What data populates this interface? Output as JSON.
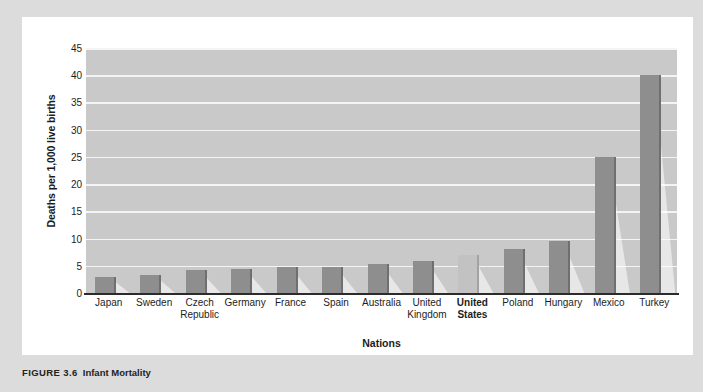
{
  "caption": {
    "figure_number": "FIGURE 3.6",
    "title": "Infant Mortality"
  },
  "chart_data": {
    "type": "bar",
    "title": "Infant Mortality",
    "xlabel": "Nations",
    "ylabel": "Deaths per 1,000 live births",
    "ylim": [
      0,
      45
    ],
    "yticks": [
      0,
      5,
      10,
      15,
      20,
      25,
      30,
      35,
      40,
      45
    ],
    "grid": true,
    "legend": "none",
    "highlight_category": "United States",
    "colors": {
      "bar": "#8e8e8e",
      "bar_highlight": "#c2c2c2",
      "plot_background": "#c9c9c9",
      "gridline": "#f4f4f4",
      "panel_background": "#ffffff",
      "page_background": "#dcdcdc"
    },
    "categories": [
      "Japan",
      "Sweden",
      "Czech Republic",
      "Germany",
      "France",
      "Spain",
      "Australia",
      "United Kingdom",
      "United States",
      "Poland",
      "Hungary",
      "Mexico",
      "Turkey"
    ],
    "category_lines": [
      [
        "Japan"
      ],
      [
        "Sweden"
      ],
      [
        "Czech",
        "Republic"
      ],
      [
        "Germany"
      ],
      [
        "France"
      ],
      [
        "Spain"
      ],
      [
        "Australia"
      ],
      [
        "United",
        "Kingdom"
      ],
      [
        "United",
        "States"
      ],
      [
        "Poland"
      ],
      [
        "Hungary"
      ],
      [
        "Mexico"
      ],
      [
        "Turkey"
      ]
    ],
    "values": [
      3.0,
      3.3,
      4.2,
      4.4,
      4.7,
      4.8,
      5.3,
      5.9,
      7.0,
      8.0,
      9.5,
      25.0,
      40.0
    ]
  }
}
